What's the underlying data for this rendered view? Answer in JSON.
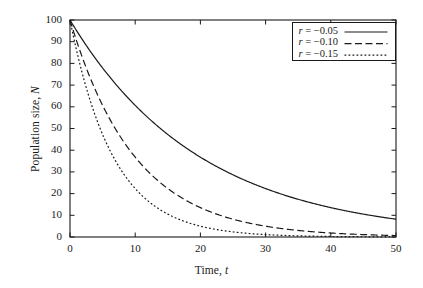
{
  "chart_data": {
    "type": "line",
    "title": "",
    "xlabel": "Time, t",
    "ylabel": "Population size, N",
    "xlabel_parts": {
      "text": "Time, ",
      "symbol": "t"
    },
    "ylabel_parts": {
      "text": "Population size, ",
      "symbol": "N"
    },
    "xlim": [
      0,
      50
    ],
    "ylim": [
      0,
      100
    ],
    "xticks": [
      0,
      10,
      20,
      30,
      40,
      50
    ],
    "yticks": [
      0,
      10,
      20,
      30,
      40,
      50,
      60,
      70,
      80,
      90,
      100
    ],
    "xtick_labels": [
      "0",
      "10",
      "20",
      "30",
      "40",
      "50"
    ],
    "ytick_labels": [
      "0",
      "10",
      "20",
      "30",
      "40",
      "50",
      "60",
      "70",
      "80",
      "90",
      "100"
    ],
    "grid": false,
    "legend_position": "top-right",
    "model": "N = 100 * exp(r * t)",
    "initial_population": 100,
    "series": [
      {
        "name": "r = -0.05",
        "label_lhs": "r",
        "label_rhs": "= −0.05",
        "rate": -0.05,
        "style": "solid",
        "color": "#1a1a1a",
        "x": [
          0,
          5,
          10,
          15,
          20,
          25,
          30,
          35,
          40,
          45,
          50
        ],
        "values": [
          100.0,
          77.9,
          60.7,
          47.2,
          36.8,
          28.7,
          22.3,
          17.4,
          13.5,
          10.5,
          8.2
        ]
      },
      {
        "name": "r = -0.10",
        "label_lhs": "r",
        "label_rhs": "= −0.10",
        "rate": -0.1,
        "style": "dashed",
        "color": "#1a1a1a",
        "x": [
          0,
          5,
          10,
          15,
          20,
          25,
          30,
          35,
          40,
          45,
          50
        ],
        "values": [
          100.0,
          60.7,
          36.8,
          22.3,
          13.5,
          8.2,
          5.0,
          3.0,
          1.8,
          1.1,
          0.7
        ]
      },
      {
        "name": "r = -0.15",
        "label_lhs": "r",
        "label_rhs": "= −0.15",
        "rate": -0.15,
        "style": "dotted",
        "color": "#1a1a1a",
        "x": [
          0,
          5,
          10,
          15,
          20,
          25,
          30,
          35,
          40,
          45,
          50
        ],
        "values": [
          100.0,
          47.2,
          22.3,
          10.5,
          5.0,
          2.4,
          1.1,
          0.5,
          0.2,
          0.1,
          0.1
        ]
      }
    ]
  },
  "colors": {
    "background": "#ffffff",
    "axis": "#1a1a1a",
    "line": "#1a1a1a"
  }
}
